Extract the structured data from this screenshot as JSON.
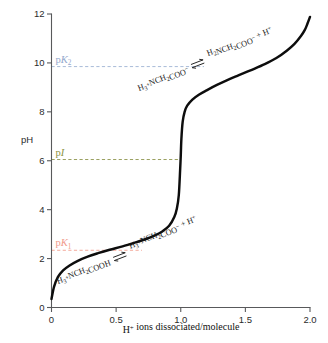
{
  "chart_data": {
    "type": "line",
    "title": "",
    "xlabel": "H+ ions dissociated/molecule",
    "ylabel": "pH",
    "xlim": [
      0,
      2.0
    ],
    "ylim": [
      0,
      12
    ],
    "grid": false,
    "legend": "none",
    "x_ticks": [
      "0",
      "0.5",
      "1.0",
      "1.5",
      "2.0"
    ],
    "x_tick_values": [
      0,
      0.5,
      1.0,
      1.5,
      2.0
    ],
    "y_ticks": [
      "0",
      "2",
      "4",
      "6",
      "8",
      "10",
      "12"
    ],
    "y_tick_values": [
      0,
      2,
      4,
      6,
      8,
      10,
      12
    ],
    "series": [
      {
        "name": "glycine titration curve",
        "x": [
          0.0,
          0.02,
          0.05,
          0.09,
          0.14,
          0.2,
          0.28,
          0.36,
          0.45,
          0.55,
          0.65,
          0.72,
          0.8,
          0.86,
          0.91,
          0.95,
          0.97,
          0.985,
          0.995,
          1.0,
          1.005,
          1.015,
          1.03,
          1.05,
          1.09,
          1.14,
          1.2,
          1.28,
          1.36,
          1.45,
          1.55,
          1.65,
          1.74,
          1.82,
          1.88,
          1.93,
          1.96,
          1.98,
          2.0
        ],
        "y": [
          0.35,
          0.85,
          1.25,
          1.52,
          1.72,
          1.9,
          2.08,
          2.22,
          2.36,
          2.5,
          2.66,
          2.78,
          2.95,
          3.12,
          3.34,
          3.7,
          4.05,
          4.6,
          5.6,
          6.2,
          6.9,
          7.6,
          8.0,
          8.25,
          8.5,
          8.7,
          8.88,
          9.1,
          9.3,
          9.5,
          9.72,
          9.95,
          10.2,
          10.5,
          10.78,
          11.1,
          11.35,
          11.6,
          11.88
        ]
      }
    ],
    "reference_lines": [
      {
        "id": "pK1",
        "label_prefix": "p",
        "label_italic": "K",
        "label_sub": "1",
        "value": 2.34,
        "color": "#f4a99b",
        "label_color": "#f09a8b",
        "x_start": 0.0,
        "x_end": 0.7
      },
      {
        "id": "pI",
        "label_prefix": "p",
        "label_italic": "I",
        "label_sub": "",
        "value": 6.05,
        "color": "#9aa060",
        "label_color": "#8c923f",
        "x_start": 0.0,
        "x_end": 0.99
      },
      {
        "id": "pK2",
        "label_prefix": "p",
        "label_italic": "K",
        "label_sub": "2",
        "value": 9.85,
        "color": "#a9bbd8",
        "label_color": "#93a8cc",
        "x_start": 0.0,
        "x_end": 1.18
      }
    ],
    "annotations": [
      {
        "id": "lower-equilibrium",
        "reactant": "H3+NCH2COOH",
        "product": "H3+NCH2COO- + H+",
        "arrow": "equilibrium-double-arrow",
        "reactant_parts": [
          {
            "t": "H",
            "k": "n"
          },
          {
            "t": "3",
            "k": "sub"
          },
          {
            "t": "+",
            "k": "sup"
          },
          {
            "t": "NCH",
            "k": "n"
          },
          {
            "t": "2",
            "k": "sub"
          },
          {
            "t": "COOH",
            "k": "n"
          }
        ],
        "product_parts": [
          {
            "t": "H",
            "k": "n"
          },
          {
            "t": "3",
            "k": "sub"
          },
          {
            "t": "+",
            "k": "sup"
          },
          {
            "t": "NCH",
            "k": "n"
          },
          {
            "t": "2",
            "k": "sub"
          },
          {
            "t": "COO",
            "k": "n"
          },
          {
            "t": "−",
            "k": "sup"
          },
          {
            "t": "  + H",
            "k": "n"
          },
          {
            "t": "+",
            "k": "sup"
          }
        ],
        "reactant_color": "#1a1a1a",
        "product_color": "#1a1a1a",
        "trailing_color": "#f09a8b"
      },
      {
        "id": "upper-equilibrium",
        "reactant": "H3+NCH2COO-",
        "product": "H2NCH2COO- + H+",
        "arrow": "equilibrium-double-arrow",
        "reactant_parts": [
          {
            "t": "H",
            "k": "n"
          },
          {
            "t": "3",
            "k": "sub"
          },
          {
            "t": "+",
            "k": "sup"
          },
          {
            "t": "NCH",
            "k": "n"
          },
          {
            "t": "2",
            "k": "sub"
          },
          {
            "t": "COO",
            "k": "n"
          },
          {
            "t": "−",
            "k": "sup"
          }
        ],
        "product_parts": [
          {
            "t": "H",
            "k": "n"
          },
          {
            "t": "2",
            "k": "sub"
          },
          {
            "t": "NCH",
            "k": "n"
          },
          {
            "t": "2",
            "k": "sub"
          },
          {
            "t": "COO",
            "k": "n"
          },
          {
            "t": "−",
            "k": "sup"
          },
          {
            "t": "  + H",
            "k": "n"
          },
          {
            "t": "+",
            "k": "sup"
          }
        ],
        "reactant_color": "#93a8cc",
        "product_color": "#1a1a1a",
        "trailing_color": "#93a8cc"
      }
    ]
  },
  "axis": {
    "y_label": "pH",
    "x_label_parts": [
      {
        "t": "H",
        "k": "n"
      },
      {
        "t": "+",
        "k": "sup"
      },
      {
        "t": " ions dissociated/molecule",
        "k": "n"
      }
    ],
    "x_label_text": "H+ ions dissociated/molecule"
  },
  "colors": {
    "curve": "#0d0d0d",
    "axis": "#58595b",
    "pk1": "#f4a99b",
    "pi": "#9aa060",
    "pk2": "#a9bbd8",
    "background": "#ffffff"
  }
}
